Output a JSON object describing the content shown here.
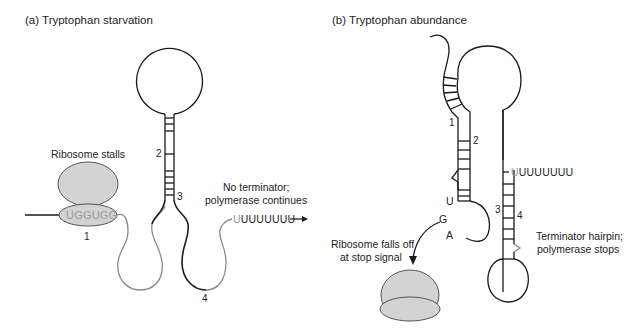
{
  "panel_a": {
    "title": "(a) Tryptophan starvation",
    "ribosome_label": "Ribosome stalls",
    "codons": "UGGUGG",
    "region_labels": {
      "r1": "1",
      "r2": "2",
      "r3": "3",
      "r4": "4"
    },
    "terminator_note_line1": "No terminator;",
    "terminator_note_line2": "polymerase continues",
    "u_tract_first": "U",
    "u_tract_rest": "UUUUUUU"
  },
  "panel_b": {
    "title": "(b) Tryptophan abundance",
    "region_labels": {
      "r1": "1",
      "r2": "2",
      "r3": "3",
      "r4": "4"
    },
    "stop_codon": {
      "u": "U",
      "g": "G",
      "a": "A"
    },
    "ribosome_note_line1": "Ribosome falls off",
    "ribosome_note_line2": "at stop signal",
    "u_tract_first": "U",
    "u_tract_rest": "UUUUUUU",
    "terminator_note_line1": "Terminator hairpin;",
    "terminator_note_line2": "polymerase stops"
  },
  "colors": {
    "ribosome_fill": "#d3d3d3",
    "line": "#1a1a1a",
    "light_line": "#8a8a8a",
    "gray_text": "#9a9a9a"
  }
}
